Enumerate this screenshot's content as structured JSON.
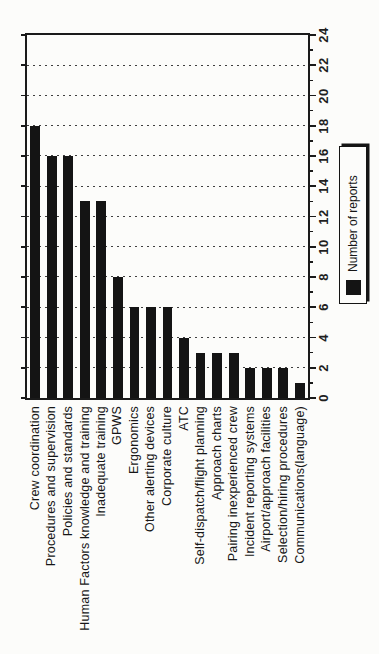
{
  "chart_data": {
    "type": "bar",
    "title": "",
    "xlabel": "",
    "ylabel": "",
    "legend": "Number of reports",
    "legend_position": "right",
    "presentation": "entire figure rotated 90deg CCW for portrait page; all text reads bottom-to-top",
    "categories": [
      "Crew coordination",
      "Procedures and supervision",
      "Policies and standards",
      "Human Factors knowledge and training",
      "Inadequate training",
      "GPWS",
      "Ergonomics",
      "Other alerting devices",
      "Corporate culture",
      "ATC",
      "Self-dispatch/flight planning",
      "Approach charts",
      "Pairing inexperienced crew",
      "Incident reporting systems",
      "Airport/approach facilities",
      "Selection/hiring procedures",
      "Communications(language)"
    ],
    "values": [
      18,
      16,
      16,
      13,
      13,
      8,
      6,
      6,
      6,
      4,
      3,
      3,
      3,
      2,
      2,
      2,
      1
    ],
    "ylim": [
      0,
      24
    ],
    "ytick_step": 2,
    "ytick_minor_step": 1,
    "ytick_labels": [
      "0",
      "2",
      "4",
      "6",
      "8",
      "10",
      "12",
      "14",
      "16",
      "18",
      "20",
      "22",
      "24"
    ],
    "grid": "dotted horizontal lines at even values",
    "colors": {
      "bar": "#141414",
      "axis": "#1a1a1a",
      "grid": "#3f3f3f",
      "background": "#fcfcfa",
      "text": "#1a1a1a"
    }
  }
}
